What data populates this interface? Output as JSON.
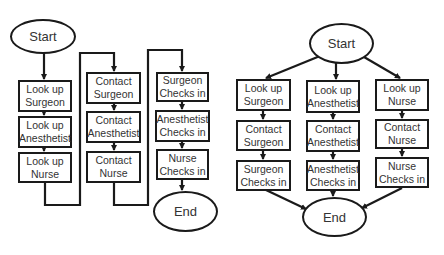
{
  "colors": {
    "stroke": "#1a1a1a",
    "text": "#333333",
    "background": "#ffffff"
  },
  "left_diagram": {
    "start": "Start",
    "end": "End",
    "columns": [
      [
        "Look up\nSurgeon",
        "Look up\nAnesthetist",
        "Look up\nNurse"
      ],
      [
        "Contact\nSurgeon",
        "Contact\nAnesthetist",
        "Contact\nNurse"
      ],
      [
        "Surgeon\nChecks in",
        "Anesthetist\nChecks in",
        "Nurse\nChecks in"
      ]
    ]
  },
  "right_diagram": {
    "start": "Start",
    "end": "End",
    "columns": [
      [
        "Look up\nSurgeon",
        "Contact\nSurgeon",
        "Surgeon\nChecks in"
      ],
      [
        "Look up\nAnesthetist",
        "Contact\nAnesthetist",
        "Anesthetist\nChecks in"
      ],
      [
        "Look up\nNurse",
        "Contact\nNurse",
        "Nurse\nChecks in"
      ]
    ]
  }
}
